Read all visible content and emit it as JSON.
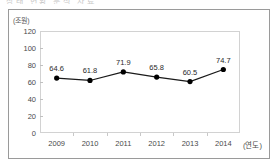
{
  "header": {
    "clipped_text": "상태 현황 분석 자료"
  },
  "chart_data": {
    "type": "line",
    "title": "",
    "xlabel": "(연도)",
    "ylabel": "(조원)",
    "categories": [
      "2009",
      "2010",
      "2011",
      "2012",
      "2013",
      "2014"
    ],
    "values": [
      64.6,
      61.8,
      71.9,
      65.8,
      60.5,
      74.7
    ],
    "data_labels": [
      "64.6",
      "61.8",
      "71.9",
      "65.8",
      "60.5",
      "74.7"
    ],
    "ylim": [
      0,
      120
    ],
    "y_ticks": [
      120,
      100,
      80,
      60,
      40,
      20,
      0
    ],
    "y_tick_labels": [
      "120",
      "100",
      "80",
      "60",
      "40",
      "20",
      "0"
    ],
    "grid": false,
    "legend": false,
    "series_color": "#1a1a1a",
    "marker": "circle",
    "marker_color": "#000000",
    "plot_border_color": "#d2d2d2",
    "frame_color": "#9a9a9a"
  }
}
